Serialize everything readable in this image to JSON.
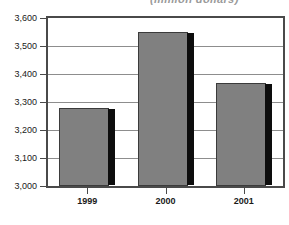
{
  "chart_data": {
    "type": "bar",
    "title": "(million dollars)",
    "xlabel": "",
    "ylabel": "",
    "categories": [
      "1999",
      "2000",
      "2001"
    ],
    "values": [
      3279,
      3551,
      3367
    ],
    "ylim": [
      3000,
      3600
    ],
    "ytick_values": [
      3600,
      3500,
      3400,
      3300,
      3200,
      3100,
      3000
    ],
    "ytick_labels": [
      "3,600",
      "3,500",
      "3,400",
      "3,300",
      "3,200",
      "3,100",
      "3,000"
    ],
    "grid": true,
    "legend": "none",
    "series": [
      {
        "name": "value",
        "values": [
          3279,
          3551,
          3367
        ]
      }
    ],
    "colors": {
      "bar_fill": "#808080",
      "bar_outline": "#3b3b3b",
      "bar_shadow": "#0d0d0d",
      "gridline": "#8d8d8d",
      "frame": "#4a4a4a",
      "background": "#ffffff",
      "text": "#1a1a1a",
      "title_text": "#9a9a9a"
    }
  }
}
